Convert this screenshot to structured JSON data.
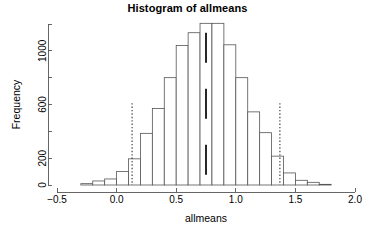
{
  "chart_data": {
    "type": "bar",
    "title": "Histogram of allmeans",
    "xlabel": "allmeans",
    "ylabel": "Frequency",
    "xlim": [
      -0.5,
      2.0
    ],
    "ylim": [
      0,
      1200
    ],
    "grid": false,
    "legend": null,
    "bin_width": 0.1,
    "x_ticks": [
      -0.5,
      0.0,
      0.5,
      1.0,
      1.5,
      2.0
    ],
    "x_tick_labels": [
      "-0.5",
      "0.0",
      "0.5",
      "1.0",
      "1.5",
      "2.0"
    ],
    "y_ticks": [
      0,
      200,
      400,
      600,
      800,
      1000,
      1200
    ],
    "y_tick_labels": [
      "0",
      "200",
      "",
      "600",
      "",
      "1000",
      ""
    ],
    "bin_starts": [
      -0.3,
      -0.2,
      -0.1,
      0.0,
      0.1,
      0.2,
      0.3,
      0.4,
      0.5,
      0.6,
      0.7,
      0.8,
      0.9,
      1.0,
      1.1,
      1.2,
      1.3,
      1.4,
      1.5,
      1.6,
      1.7
    ],
    "categories": [
      "-0.3",
      "-0.2",
      "-0.1",
      "0.0",
      "0.1",
      "0.2",
      "0.3",
      "0.4",
      "0.5",
      "0.6",
      "0.7",
      "0.8",
      "0.9",
      "1.0",
      "1.1",
      "1.2",
      "1.3",
      "1.4",
      "1.5",
      "1.6",
      "1.7"
    ],
    "values": [
      10,
      30,
      45,
      100,
      195,
      385,
      570,
      800,
      1040,
      1135,
      1205,
      1205,
      1045,
      800,
      545,
      390,
      215,
      90,
      35,
      20,
      5
    ],
    "annotations": [
      {
        "name": "lower-ci",
        "type": "vline",
        "x": 0.13,
        "style": "dotted",
        "y_top": 610
      },
      {
        "name": "sample-mean",
        "type": "vline",
        "x": 0.75,
        "style": "segmented",
        "y_top": 1135
      },
      {
        "name": "upper-ci",
        "type": "vline",
        "x": 1.37,
        "style": "dotted",
        "y_top": 610
      }
    ]
  }
}
